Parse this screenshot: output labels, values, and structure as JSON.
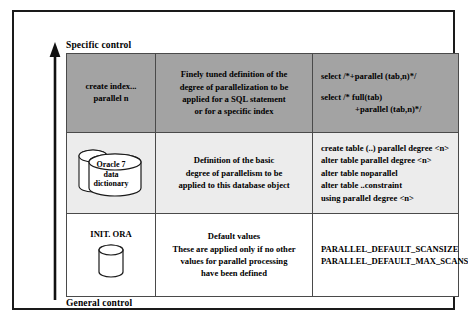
{
  "figure": {
    "axis": {
      "top_label": "Specific control",
      "bottom_label": "General control",
      "arrow_icon": "up-arrow-icon"
    },
    "columns": [
      {
        "key": "source",
        "header": ""
      },
      {
        "key": "meaning",
        "header": ""
      },
      {
        "key": "syntax",
        "header": ""
      }
    ],
    "rows": [
      {
        "name": "specific-control-row",
        "background": "#a3a3a3",
        "source": {
          "type": "text",
          "lines": [
            "create index...",
            "parallel n"
          ]
        },
        "meaning": [
          "Finely tuned definition of the",
          "degree of parallelization to be",
          "applied for a SQL statement",
          "or for a specific index"
        ],
        "syntax": [
          "select /*+parallel (tab,n)*/",
          "",
          "select /* full(tab)",
          "+parallel (tab,n)*/"
        ]
      },
      {
        "name": "object-control-row",
        "background": "#ececec",
        "source": {
          "type": "database-icon",
          "icon": "database-cylinder-icon",
          "lines": [
            "Oracle 7",
            "data",
            "dictionary"
          ]
        },
        "meaning": [
          "Definition of the basic",
          "degree of parallelism to be",
          "applied to this database object"
        ],
        "syntax": [
          "create table (..) parallel degree <n>",
          "alter table parallel degree <n>",
          "alter table noparallel",
          "alter table ..constraint",
          "using parallel degree <n>"
        ]
      },
      {
        "name": "general-control-row",
        "background": "#ffffff",
        "source": {
          "type": "file-icon",
          "icon": "database-cylinder-icon",
          "label": "INIT. ORA"
        },
        "meaning": [
          "Default values",
          "These are applied only if no other",
          "values for parallel processing",
          "have been defined"
        ],
        "syntax": [
          "PARALLEL_DEFAULT_SCANSIZE",
          "PARALLEL_DEFAULT_MAX_SCANS"
        ]
      }
    ],
    "colors": {
      "frame_border": "#1a1a1a",
      "cell_border": "#4a4a4a",
      "row_specific_bg": "#a3a3a3",
      "row_object_bg": "#ececec",
      "row_general_bg": "#ffffff",
      "text": "#000000"
    }
  }
}
